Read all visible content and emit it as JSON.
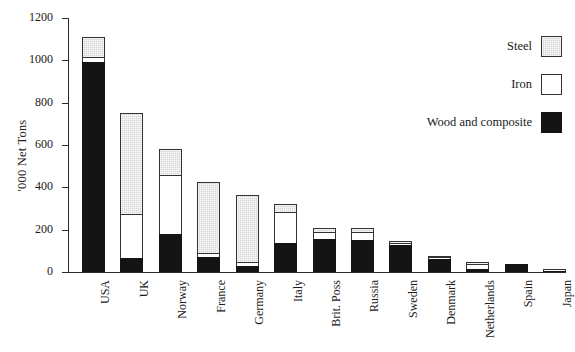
{
  "chart_data": {
    "type": "bar",
    "stacked": true,
    "title": "",
    "subtitle": "",
    "xlabel": "",
    "ylabel": "'000 Net Tons",
    "ylim": [
      0,
      1200
    ],
    "ytick_values": [
      0,
      200,
      400,
      600,
      800,
      1000,
      1200
    ],
    "ytick_labels": [
      "0",
      "200",
      "400",
      "600",
      "800",
      "1000",
      "1200"
    ],
    "grid": false,
    "legend_position": "top-right",
    "categories": [
      "USA",
      "UK",
      "Norway",
      "France",
      "Germany",
      "Italy",
      "Brit. Poss",
      "Russia",
      "Sweden",
      "Denmark",
      "Netherlands",
      "Spain",
      "Japan"
    ],
    "series": [
      {
        "name": "Wood and composite",
        "color": "#141414",
        "values": [
          990,
          66,
          180,
          71,
          28,
          137,
          156,
          151,
          128,
          61,
          14,
          38,
          6
        ]
      },
      {
        "name": "Iron",
        "color": "#ffffff",
        "values": [
          26,
          208,
          278,
          19,
          19,
          146,
          33,
          38,
          8,
          8,
          25,
          0,
          2
        ]
      },
      {
        "name": "Steel",
        "color": "#d6d6d6",
        "values": [
          94,
          476,
          122,
          335,
          317,
          37,
          19,
          19,
          10,
          7,
          8,
          0,
          0
        ]
      }
    ],
    "totals": [
      1110,
      750,
      580,
      425,
      364,
      320,
      208,
      208,
      146,
      76,
      47,
      38,
      8
    ]
  },
  "axis": {
    "y_title": "'000 Net Tons"
  },
  "legend": {
    "items": [
      {
        "label": "Steel",
        "swatch": "steel-swatch"
      },
      {
        "label": "Iron",
        "swatch": "iron-swatch"
      },
      {
        "label": "Wood and composite",
        "swatch": "wood-swatch"
      }
    ]
  }
}
